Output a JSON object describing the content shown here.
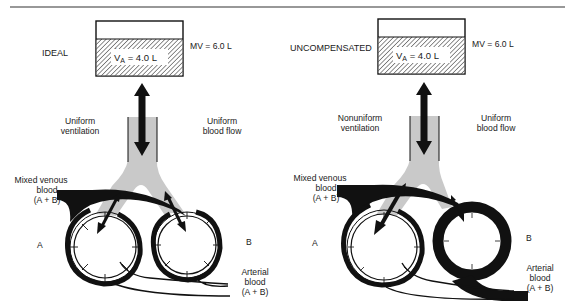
{
  "figure": {
    "panels": [
      {
        "id": "ideal",
        "title": "IDEAL",
        "minute_volume_label": "MV = 6.0 L",
        "alveolar_ventilation": {
          "symbol": "V",
          "subscript": "A",
          "rest": " = 4.0 L"
        },
        "ventilation_label": [
          "Uniform",
          "ventilation"
        ],
        "blood_flow_label": [
          "Uniform",
          "blood flow"
        ],
        "venous_label": [
          "Mixed venous",
          "blood",
          "(A + B)"
        ],
        "arterial_label": [
          "Arterial",
          "blood",
          "(A + B)"
        ],
        "unit_a": "A",
        "unit_b": "B"
      },
      {
        "id": "uncompensated",
        "title": "UNCOMPENSATED",
        "minute_volume_label": "MV = 6.0 L",
        "alveolar_ventilation": {
          "symbol": "V",
          "subscript": "A",
          "rest": " = 4.0 L"
        },
        "ventilation_label": [
          "Nonuniform",
          "ventilation"
        ],
        "blood_flow_label": [
          "Uniform",
          "blood flow"
        ],
        "venous_label": [
          "Mixed venous",
          "blood",
          "(A + B)"
        ],
        "arterial_label": [
          "Arterial",
          "blood",
          "(A + B)"
        ],
        "unit_a": "A",
        "unit_b": "B"
      }
    ],
    "colors": {
      "ink": "#111111",
      "airway_gray": "#c9c9c9",
      "background": "#ffffff"
    }
  }
}
